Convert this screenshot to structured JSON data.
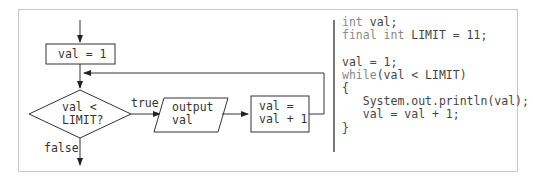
{
  "flowchart": {
    "init_box": "val = 1",
    "decision": [
      "val <",
      "LIMIT?"
    ],
    "true_label": "true",
    "false_label": "false",
    "output_box": [
      "output",
      "val"
    ],
    "increment_box": [
      "val =",
      "val + 1"
    ]
  },
  "code": {
    "lines": [
      {
        "kw": "int",
        "rest": " val;"
      },
      {
        "kw": "final int",
        "rest": " LIMIT = 11;"
      },
      {
        "kw": "",
        "rest": ""
      },
      {
        "kw": "",
        "rest": "val = 1;"
      },
      {
        "kw": "while",
        "rest": "(val < LIMIT)"
      },
      {
        "kw": "",
        "rest": "{"
      },
      {
        "kw": "",
        "rest": "   System.out.println(val);"
      },
      {
        "kw": "",
        "rest": "   val = val + 1;"
      },
      {
        "kw": "",
        "rest": "}"
      }
    ]
  }
}
